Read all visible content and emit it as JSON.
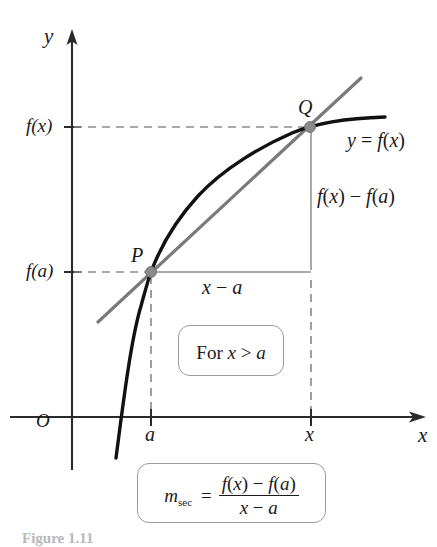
{
  "figure": {
    "caption": "Figure 1.11",
    "axes": {
      "y_label": "y",
      "x_label": "x",
      "origin_label": "O"
    },
    "tick_labels": {
      "y_upper": "f(x)",
      "y_lower": "f(a)",
      "x_left": "a",
      "x_right": "x"
    },
    "points": {
      "p_label": "P",
      "q_label": "Q"
    },
    "curve_label": "y = f(x)",
    "rise_label": "f(x) − f(a)",
    "run_label": "x − a",
    "condition_box": {
      "text": "For x > a"
    },
    "formula_box": {
      "lhs_symbol": "m",
      "lhs_subscript": "sec",
      "equals": "=",
      "numerator": "f(x) − f(a)",
      "denominator": "x − a"
    },
    "colors": {
      "curve": "#111111",
      "secant": "#7a7a7a",
      "axis": "#2b2b2b",
      "dashed": "#8d8d8d",
      "triangle": "#8d8d8d",
      "box_border": "#9a9a9a"
    }
  },
  "chart_data": {
    "type": "line",
    "xlabel": "x",
    "ylabel": "y",
    "grid": false,
    "legend": "none",
    "annotations": [
      "y = f(x)",
      "f(x) − f(a)",
      "x − a",
      "For x > a",
      "m_sec = (f(x) - f(a)) / (x - a)"
    ],
    "series": [
      {
        "name": "f(x) curve",
        "style": "solid-black-thick",
        "points_px": [
          [
            116,
            458
          ],
          [
            122,
            420
          ],
          [
            128,
            390
          ],
          [
            134,
            352
          ],
          [
            140,
            316
          ],
          [
            146,
            290
          ],
          [
            151,
            272
          ],
          [
            160,
            248
          ],
          [
            172,
            225
          ],
          [
            188,
            203
          ],
          [
            208,
            183
          ],
          [
            232,
            165
          ],
          [
            262,
            148
          ],
          [
            290,
            135
          ],
          [
            310,
            127
          ],
          [
            340,
            122
          ],
          [
            385,
            118
          ]
        ]
      },
      {
        "name": "secant line PQ",
        "style": "solid-gray",
        "endpoints_px": [
          [
            98,
            322
          ],
          [
            361,
            78
          ]
        ]
      }
    ],
    "marked_points": [
      {
        "label": "P",
        "x_tick": "a",
        "y_tick": "f(a)",
        "px": [
          151,
          272
        ]
      },
      {
        "label": "Q",
        "x_tick": "x",
        "y_tick": "f(x)",
        "px": [
          310,
          127
        ]
      }
    ],
    "axis_px": {
      "y_axis_x": 72,
      "y_axis_top": 32,
      "y_axis_bottom": 470,
      "x_axis_y": 417,
      "x_axis_left": 10,
      "x_axis_right": 425
    }
  }
}
